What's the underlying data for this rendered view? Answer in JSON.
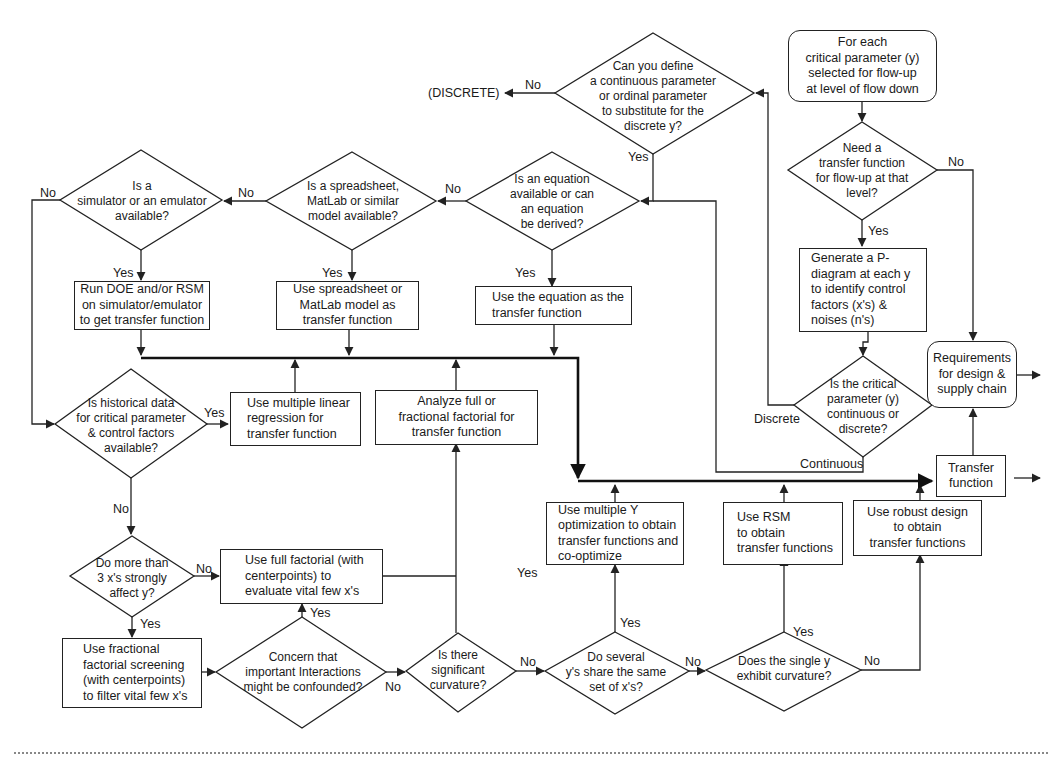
{
  "diagram": {
    "type": "flowchart",
    "colors": {
      "line": "#222222",
      "background": "#ffffff",
      "text": "#1a1a1a"
    },
    "start": {
      "id": "start",
      "shape": "rounded-rect",
      "text": "For each\ncritical parameter (y)\nselected for flow-up\nat level of flow down"
    },
    "decisions": {
      "need_tf": "Need a\ntransfer function\nfor flow-up at that\nlevel?",
      "cont_or_disc": "Is the critical\nparameter (y)\ncontinuous or\ndiscrete?",
      "define_continuous": "Can you define\na continuous parameter\nor ordinal parameter\nto substitute for the\ndiscrete y?",
      "equation": "Is an equation\navailable or can\nan equation\nbe derived?",
      "spreadsheet": "Is a spreadsheet,\nMatLab or similar\nmodel available?",
      "simulator": "Is a\nsimulator or an emulator\navailable?",
      "historical": "Is historical data\nfor critical parameter\n& control factors\navailable?",
      "more_than_3": "Do more than\n3 x's strongly\naffect y?",
      "interactions": "Concern that\nimportant Interactions\nmight be confounded?",
      "curvature": "Is there\nsignificant\ncurvature?",
      "several_ys": "Do several\ny's share the same\nset of  x's?",
      "single_y": "Does the single y\nexhibit curvature?"
    },
    "processes": {
      "p_diagram": "Generate a P-\ndiagram at each y\nto identify control\nfactors (x's) &\nnoises (n's)",
      "use_equation": "Use the equation as the\ntransfer function",
      "use_spreadsheet": "Use spreadsheet or\nMatLab model as\ntransfer function",
      "run_doe": "Run DOE and/or RSM\non simulator/emulator\nto get transfer function",
      "regression": "Use multiple linear\nregression for\ntransfer function",
      "analyze_factorial": "Analyze full or\nfractional factorial for\ntransfer function",
      "full_factorial": "Use full factorial (with\ncenterpoints)  to\nevaluate vital few x's",
      "fractional_screening": "Use fractional\nfactorial screening\n(with centerpoints)\nto filter vital few x's",
      "multiple_y": "Use multiple Y\noptimization to obtain\ntransfer functions and\nco-optimize",
      "rsm": "Use RSM\nto obtain\ntransfer functions",
      "robust_design": "Use robust design\nto obtain\ntransfer functions",
      "transfer_function": "Transfer\nfunction",
      "requirements": "Requirements\nfor design &\nsupply chain"
    },
    "terminal_labels": {
      "discrete": "(DISCRETE)"
    },
    "edge_labels": {
      "yes": "Yes",
      "no": "No",
      "discrete": "Discrete",
      "continuous": "Continuous"
    }
  }
}
